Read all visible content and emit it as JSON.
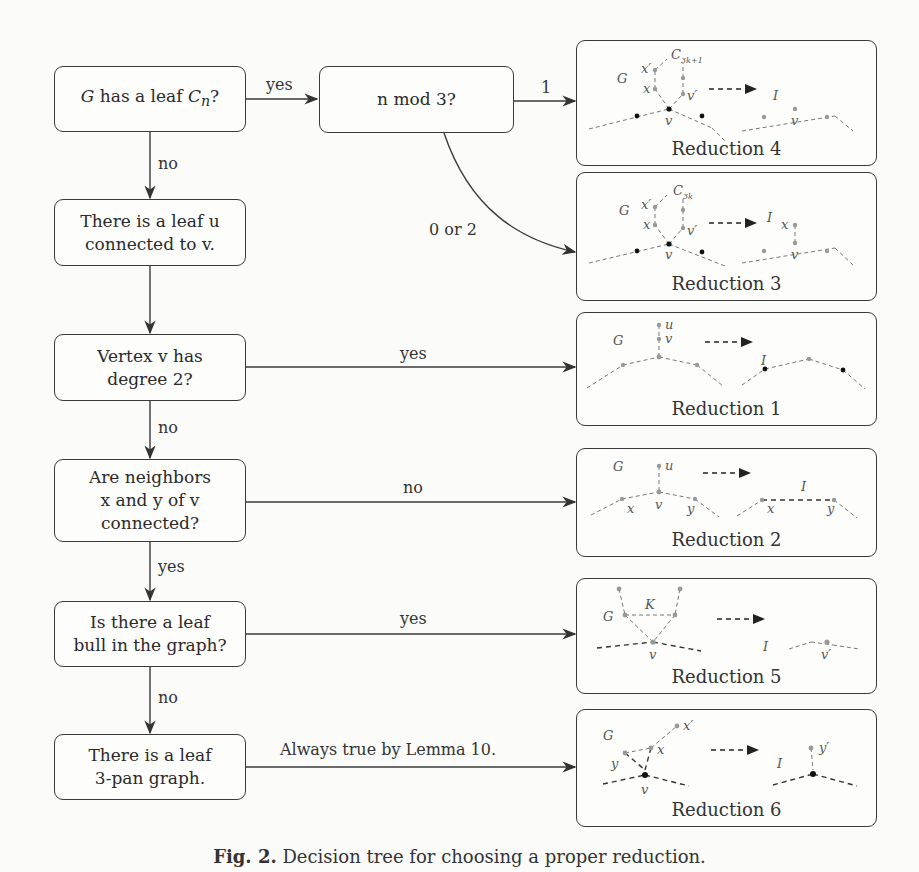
{
  "decision_nodes": [
    {
      "id": "q1",
      "text_pre": "",
      "math": "G",
      "text_mid": " has a leaf ",
      "math2": "C",
      "sub": "n",
      "text_post": "?"
    },
    {
      "id": "q2",
      "line1": "There is a leaf u",
      "line2": "connected to v."
    },
    {
      "id": "q3",
      "line1": "Vertex v has",
      "line2": "degree 2?"
    },
    {
      "id": "q4",
      "line1": "Are neighbors",
      "line2": "x and y of v",
      "line3": "connected?"
    },
    {
      "id": "q5",
      "line1": "Is there a leaf",
      "line2": "bull in the graph?"
    },
    {
      "id": "q6",
      "line1": "There is a leaf",
      "line2": "3-pan graph."
    },
    {
      "id": "mod",
      "text": "n mod 3?"
    }
  ],
  "edge_labels": {
    "q1_yes": "yes",
    "q1_no": "no",
    "mod_1": "1",
    "mod_0_or_2": "0 or 2",
    "q3_yes": "yes",
    "q3_no": "no",
    "q4_no": "no",
    "q4_yes": "yes",
    "q5_yes": "yes",
    "q5_no": "no",
    "q6_always": "Always true by Lemma 10."
  },
  "reductions": [
    {
      "label": "Reduction 4",
      "vertex_labels": [
        "G",
        "x'",
        "x",
        "C_{3k+1}",
        "v'",
        "v",
        "I",
        "v"
      ]
    },
    {
      "label": "Reduction 3",
      "vertex_labels": [
        "G",
        "x'",
        "x",
        "C_{3k}",
        "v'",
        "v",
        "I",
        "x",
        "v"
      ]
    },
    {
      "label": "Reduction 1",
      "vertex_labels": [
        "G",
        "u",
        "v",
        "I"
      ]
    },
    {
      "label": "Reduction 2",
      "vertex_labels": [
        "G",
        "u",
        "v",
        "x",
        "y",
        "I",
        "x",
        "y"
      ]
    },
    {
      "label": "Reduction 5",
      "vertex_labels": [
        "G",
        "K",
        "v",
        "I",
        "v'"
      ]
    },
    {
      "label": "Reduction 6",
      "vertex_labels": [
        "G",
        "x'",
        "x",
        "y",
        "v",
        "I",
        "y'"
      ]
    }
  ],
  "caption": {
    "prefix": "Fig. 2.",
    "text": " Decision tree for choosing a proper reduction."
  }
}
